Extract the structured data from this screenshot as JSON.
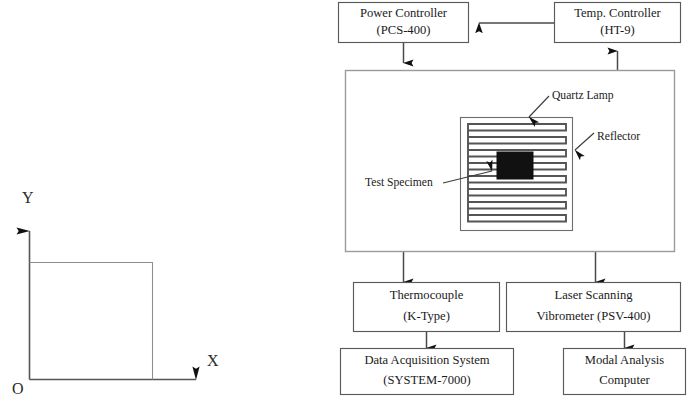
{
  "figure": {
    "background_color": "#ffffff",
    "ink_color": "#1a1a1a"
  },
  "left_panel": {
    "name": "coordinate-axes-with-plate",
    "axis_x_label": "X",
    "axis_y_label": "Y",
    "origin_label": "O",
    "plate_shape": "square"
  },
  "blocks": {
    "power_controller": {
      "line1": "Power Controller",
      "line2": "(PCS-400)"
    },
    "temp_controller": {
      "line1": "Temp. Controller",
      "line2": "(HT-9)"
    },
    "thermocouple": {
      "line1": "Thermocouple",
      "line2": "(K-Type)"
    },
    "laser_vibrometer": {
      "line1": "Laser Scanning",
      "line2": "Vibrometer  (PSV-400)"
    },
    "data_acquisition": {
      "line1": "Data Acquisition System",
      "line2": "(SYSTEM-7000)"
    },
    "modal_computer": {
      "line1": "Modal Analysis",
      "line2": "Computer"
    }
  },
  "chamber": {
    "name": "heating-chamber",
    "callouts": {
      "quartz_lamp": "Quartz Lamp",
      "reflector": "Reflector",
      "test_specimen": "Test Specimen"
    },
    "specimen_color": "#111111",
    "lamp_coil_count": 13
  }
}
